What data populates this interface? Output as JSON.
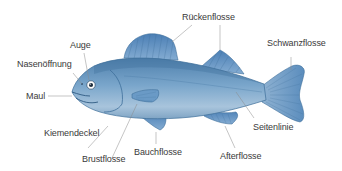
{
  "diagram": {
    "colors": {
      "body": "#6f9cc2",
      "body_dark": "#3e6f9a",
      "belly": "#a9c6de",
      "fin": "#5f90c0",
      "leader_line": "#8a8a8a",
      "text": "#3a3a3a"
    },
    "labels": [
      {
        "id": "rueckenflosse",
        "text": "Rückenflosse"
      },
      {
        "id": "auge",
        "text": "Auge"
      },
      {
        "id": "schwanzflosse",
        "text": "Schwanzflosse"
      },
      {
        "id": "nasenoeffnung",
        "text": "Nasenöffnung"
      },
      {
        "id": "maul",
        "text": "Maul"
      },
      {
        "id": "kiemendeckel",
        "text": "Kiemendeckel"
      },
      {
        "id": "seitenlinie",
        "text": "Seitenlinie"
      },
      {
        "id": "brustflosse",
        "text": "Brustflosse"
      },
      {
        "id": "bauchflosse",
        "text": "Bauchflosse"
      },
      {
        "id": "afterflosse",
        "text": "Afterflosse"
      }
    ]
  }
}
